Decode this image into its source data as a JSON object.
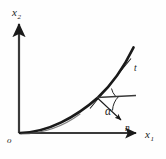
{
  "figure": {
    "caption": "",
    "background_color": "#fefefe",
    "ink_color": "#1a1a1a",
    "width": 166,
    "height": 159
  },
  "axes": {
    "vertical": {
      "label_base": "x",
      "label_sub": "2",
      "name": "x2-axis",
      "origin_px": [
        19,
        133
      ],
      "tip_px": [
        19,
        20
      ]
    },
    "horizontal": {
      "label_base": "x",
      "label_sub": "1",
      "name": "x1-axis",
      "origin_px": [
        19,
        133
      ],
      "tip_px": [
        141,
        133
      ]
    },
    "origin": {
      "label": "o",
      "px": [
        10,
        139
      ]
    }
  },
  "curve": {
    "name": "boundary-curve",
    "description": "thick convex curve rising from origin to upper right",
    "stroke_width": 2.6,
    "path": "M 20 133 C 48 132 76 116 98 97 C 112 84 124 66 133 48",
    "start_px": [
      20,
      133
    ],
    "end_px": [
      133,
      48
    ]
  },
  "tangent": {
    "name": "tangent-line",
    "label": "t",
    "label_px": [
      136,
      68
    ],
    "from_px": [
      90,
      108
    ],
    "to_px": [
      131,
      59
    ],
    "stroke_width": 1.0
  },
  "reference_line": {
    "name": "horizontal-reference-line",
    "from_px": [
      97,
      97
    ],
    "to_px": [
      136,
      95
    ],
    "stroke_width": 1.6
  },
  "normal": {
    "name": "normal-vector",
    "label": "n",
    "label_px": [
      128,
      128
    ],
    "from_px": [
      97,
      97
    ],
    "to_px": [
      122,
      121
    ],
    "stroke_width": 1.0
  },
  "angle": {
    "name": "angle-alpha",
    "label": "α",
    "label_px": [
      110,
      111
    ],
    "arc_path": "M 118 97 A 21 21 0 0 0 112 110",
    "tangent_arc_path": "M 112 89 A 17 17 0 0 0 116 96"
  },
  "labels": [
    {
      "id": "x2",
      "text": "x",
      "sub": "2"
    },
    {
      "id": "x1",
      "text": "x",
      "sub": "1"
    },
    {
      "id": "o",
      "text": "o"
    },
    {
      "id": "t",
      "text": "t"
    },
    {
      "id": "n",
      "text": "n"
    },
    {
      "id": "alpha",
      "text": "α"
    }
  ]
}
